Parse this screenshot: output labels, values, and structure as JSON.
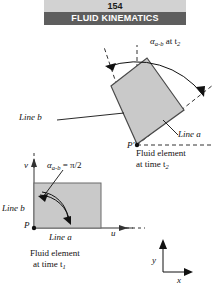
{
  "header": {
    "page_number": "154",
    "chapter_title": "FLUID KINEMATICS"
  },
  "figure": {
    "upper": {
      "angle_label_alpha": "α",
      "angle_label_sub": "a-b",
      "angle_label_rest": " at t",
      "angle_label_time_sub": "2",
      "line_b_label": "Line b",
      "line_a_label": "Line a",
      "point_label": "P′",
      "caption_line1": "Fluid element",
      "caption_line2": "at time t",
      "caption_sub": "2"
    },
    "lower": {
      "angle_label_alpha": "α",
      "angle_label_sub": "a-b",
      "angle_label_rest": " = π/2",
      "axis_v": "v",
      "axis_u": "u",
      "line_b_label": "Line b",
      "line_a_label": "Line a",
      "point_label": "P",
      "caption_line1": "Fluid element",
      "caption_line2": "at time t",
      "caption_sub": "1"
    },
    "axes_key": {
      "y_label": "y",
      "x_label": "x"
    }
  },
  "colors": {
    "element_fill": "#c9c9c9",
    "element_stroke": "#4a4a4a",
    "header_band": "#d2d2d2",
    "header_bar": "#5e5e5e",
    "ink": "#111111"
  }
}
